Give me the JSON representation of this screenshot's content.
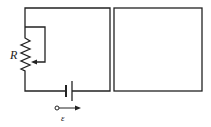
{
  "diagram": {
    "type": "circuit",
    "labels": {
      "resistor": "R",
      "emf": "ε"
    },
    "components": [
      {
        "name": "variable-resistor",
        "label": "R"
      },
      {
        "name": "battery",
        "label": "ε"
      },
      {
        "name": "left-loop"
      },
      {
        "name": "right-loop"
      }
    ],
    "colors": {
      "stroke": "#222222",
      "background": "#ffffff"
    }
  }
}
